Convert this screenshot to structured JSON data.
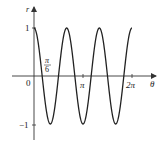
{
  "chart_data": {
    "type": "line",
    "title": "",
    "function": "r = cos(3θ)",
    "xlabel": "θ",
    "ylabel": "r",
    "xlim": [
      0,
      6.2832
    ],
    "ylim": [
      -1,
      1
    ],
    "x_ticks": [
      {
        "value": 0.5236,
        "label": "π/6"
      },
      {
        "value": 3.1416,
        "label": "π"
      },
      {
        "value": 6.2832,
        "label": "2π"
      }
    ],
    "y_ticks": [
      {
        "value": 1,
        "label": "1"
      },
      {
        "value": -1,
        "label": "-1"
      }
    ],
    "origin_label": "0",
    "series": [
      {
        "name": "r = cos 3θ",
        "x": [
          0,
          0.5236,
          1.0472,
          1.5708,
          2.0944,
          2.618,
          3.1416,
          3.6652,
          4.1888,
          4.7124,
          5.236,
          5.7596,
          6.2832
        ],
        "values": [
          1,
          0,
          -1,
          0,
          1,
          0,
          -1,
          0,
          1,
          0,
          -1,
          0,
          1
        ]
      }
    ],
    "grid": false,
    "legend": "none",
    "colors": {
      "curve": "#222222",
      "axes": "#333333"
    }
  },
  "labels": {
    "y_axis": "r",
    "x_axis": "θ",
    "origin": "0",
    "tick_one": "1",
    "tick_neg_one": "−1",
    "tick_pi": "π",
    "tick_two_pi": "2π",
    "pi_over_six_num": "π",
    "pi_over_six_den": "6"
  }
}
